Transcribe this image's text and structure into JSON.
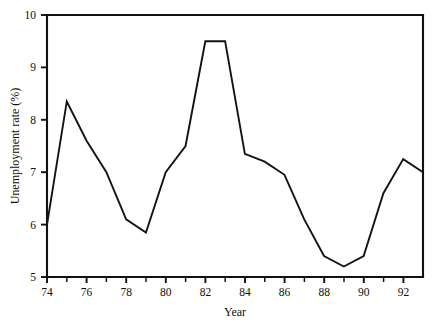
{
  "chart_data": {
    "type": "line",
    "title": "",
    "xlabel": "Year",
    "ylabel": "Unemployment rate (%)",
    "xlim": [
      74,
      93
    ],
    "ylim": [
      5,
      10
    ],
    "grid": false,
    "legend": false,
    "x_tick_labels": [
      "74",
      "76",
      "78",
      "80",
      "82",
      "84",
      "86",
      "88",
      "90",
      "92"
    ],
    "x_tick_values": [
      74,
      76,
      78,
      80,
      82,
      84,
      86,
      88,
      90,
      92
    ],
    "x_minor_ticks": [
      75,
      77,
      79,
      81,
      83,
      85,
      87,
      89,
      91,
      93
    ],
    "y_tick_labels": [
      "5",
      "6",
      "7",
      "8",
      "9",
      "10"
    ],
    "y_tick_values": [
      5,
      6,
      7,
      8,
      9,
      10
    ],
    "series": [
      {
        "name": "Unemployment rate",
        "color": "#131313",
        "x": [
          74,
          75,
          76,
          77,
          78,
          79,
          80,
          81,
          82,
          83,
          84,
          85,
          86,
          87,
          88,
          89,
          90,
          91,
          92,
          93
        ],
        "values": [
          6.0,
          8.35,
          7.6,
          7.0,
          6.1,
          5.85,
          7.0,
          7.5,
          9.5,
          9.5,
          7.35,
          7.2,
          6.95,
          6.1,
          5.4,
          5.2,
          5.4,
          6.6,
          7.25,
          7.0
        ]
      }
    ]
  },
  "axes": {
    "x_title": "Year",
    "y_title": "Unemployment rate (%)"
  }
}
